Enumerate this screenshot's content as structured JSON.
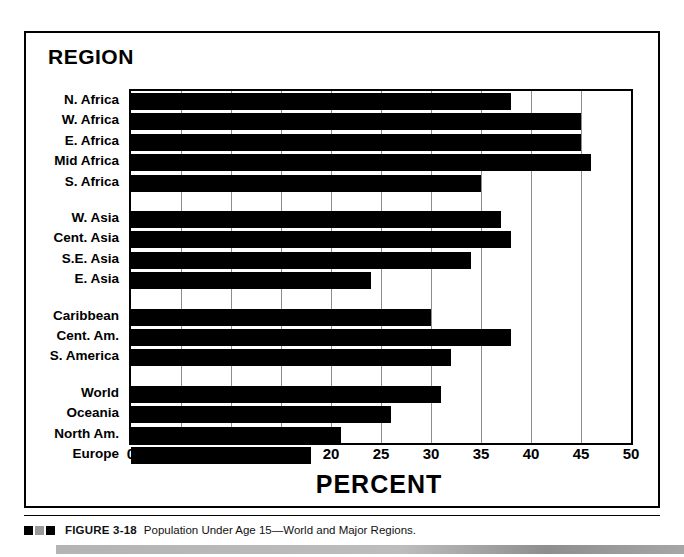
{
  "figure": {
    "region_heading": "REGION",
    "caption_figure_no": "FIGURE 3-18",
    "caption_text": "Population Under Age 15—World and Major Regions."
  },
  "chart_data": {
    "type": "bar",
    "orientation": "horizontal",
    "title": "REGION",
    "xlabel": "PERCENT",
    "ylabel": "REGION",
    "xlim": [
      0,
      50
    ],
    "xticks": [
      "0",
      "5",
      "10",
      "15",
      "20",
      "25",
      "30",
      "35",
      "40",
      "45",
      "50"
    ],
    "grid": "vertical",
    "legend": "none",
    "bar_color": "#000000",
    "categories": [
      "N. Africa",
      "W. Africa",
      "E. Africa",
      "Mid Africa",
      "S. Africa",
      "W. Asia",
      "Cent. Asia",
      "S.E. Asia",
      "E. Asia",
      "Caribbean",
      "Cent. Am.",
      "S. America",
      "World",
      "Oceania",
      "North Am.",
      "Europe"
    ],
    "values": [
      38,
      45,
      45,
      46,
      35,
      37,
      38,
      34,
      24,
      30,
      38,
      32,
      31,
      26,
      21,
      18
    ],
    "groups": [
      {
        "name": "Africa",
        "categories": [
          "N. Africa",
          "W. Africa",
          "E. Africa",
          "Mid Africa",
          "S. Africa"
        ]
      },
      {
        "name": "Asia",
        "categories": [
          "W. Asia",
          "Cent. Asia",
          "S.E. Asia",
          "E. Asia"
        ]
      },
      {
        "name": "Latin America",
        "categories": [
          "Caribbean",
          "Cent. Am.",
          "S. America"
        ]
      },
      {
        "name": "World and Developed",
        "categories": [
          "World",
          "Oceania",
          "North Am.",
          "Europe"
        ]
      }
    ]
  }
}
